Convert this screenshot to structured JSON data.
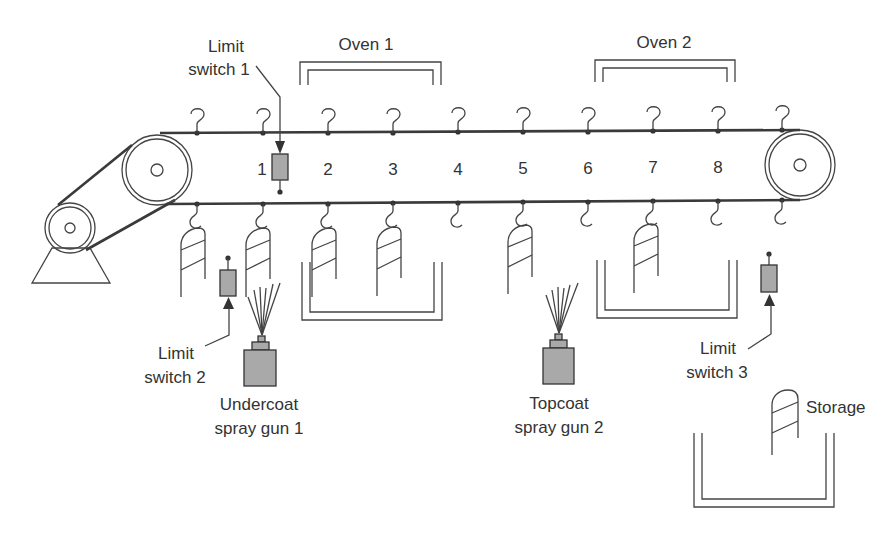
{
  "figure": {
    "type": "conveyor painting process schematic",
    "station_numbers": [
      "1",
      "2",
      "3",
      "4",
      "5",
      "6",
      "7",
      "8"
    ]
  },
  "labels": {
    "oven1": "Oven 1",
    "oven2": "Oven 2",
    "limit_switch_1": [
      "Limit",
      "switch 1"
    ],
    "limit_switch_2": [
      "Limit",
      "switch 2"
    ],
    "limit_switch_3": [
      "Limit",
      "switch 3"
    ],
    "undercoat_gun": [
      "Undercoat",
      "spray gun 1"
    ],
    "topcoat_gun": [
      "Topcoat",
      "spray gun 2"
    ],
    "storage": "Storage"
  },
  "colors": {
    "line": "#333333",
    "device_fill": "#a9a9a9",
    "background": "#ffffff"
  }
}
